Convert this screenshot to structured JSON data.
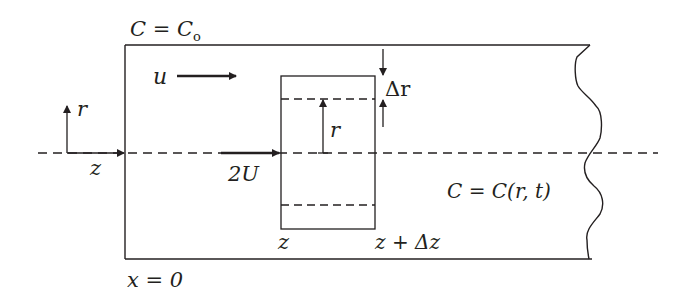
{
  "diagram": {
    "type": "flow-in-tube schematic",
    "labels": {
      "inlet_concentration": "C = C",
      "inlet_concentration_sub": "o",
      "velocity": "u",
      "delta_r": "Δr",
      "radius_inner": "r",
      "radius_axis": "r",
      "axial_axis": "z",
      "centerline_velocity": "2U",
      "concentration_field": "C = C(r, t)",
      "element_start": "z",
      "element_end": "z + Δz",
      "inlet_position": "x = 0"
    },
    "colors": {
      "stroke": "#231f20",
      "background": "#ffffff"
    }
  }
}
